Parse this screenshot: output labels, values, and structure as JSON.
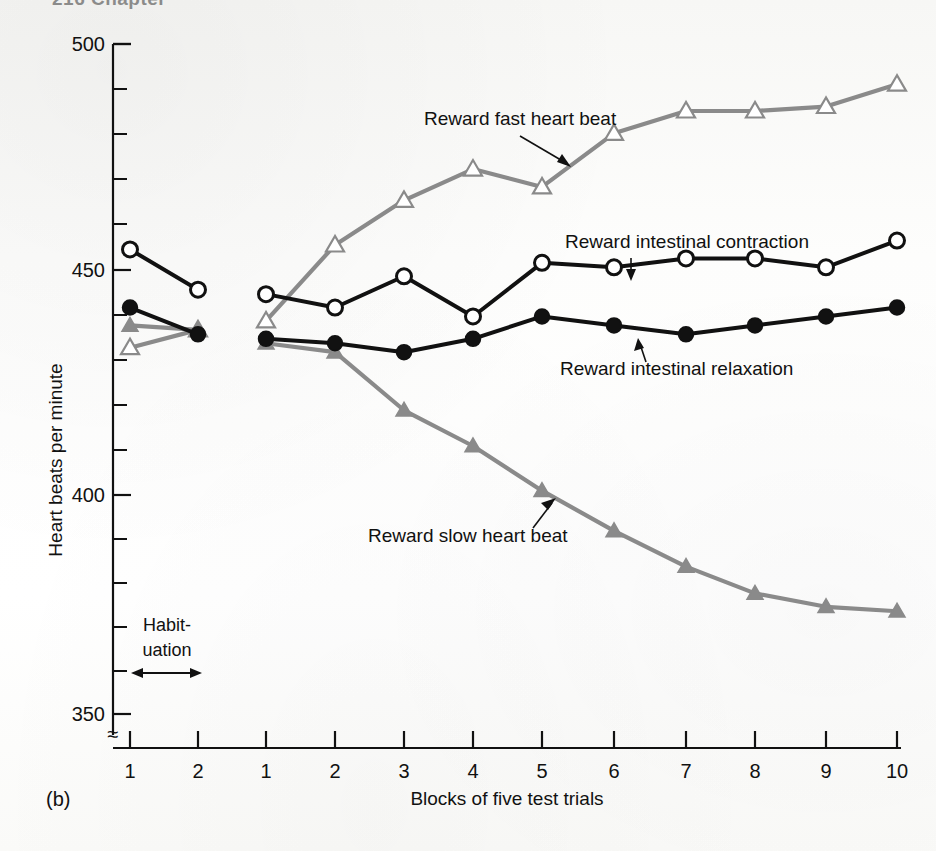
{
  "page": {
    "running_head": "216  Chapter",
    "panel_label": "(b)"
  },
  "annotations": {
    "habituation_line1": "Habit-",
    "habituation_line2": "uation"
  },
  "chart_data": {
    "type": "line",
    "title": "",
    "xlabel": "Blocks of five test trials",
    "ylabel": "Heart beats per minute",
    "ylim": [
      350,
      500
    ],
    "y_major_ticks": [
      350,
      400,
      450,
      500
    ],
    "y_major_tick_labels": [
      "350",
      "400",
      "450",
      "500"
    ],
    "y_minor_tick_step": 10,
    "grid": false,
    "axis_break": "≈",
    "x_habituation_ticks": [
      "1",
      "2"
    ],
    "x_test_ticks": [
      "1",
      "2",
      "3",
      "4",
      "5",
      "6",
      "7",
      "8",
      "9",
      "10"
    ],
    "legend_position": "inline-annotations",
    "series": [
      {
        "name": "Reward fast heart beat",
        "color": "#8a8a8a",
        "marker": "open-triangle",
        "habituation": [
          432,
          436
        ],
        "values": [
          438,
          455,
          465,
          472,
          468,
          480,
          485,
          485,
          486,
          491
        ]
      },
      {
        "name": "Reward slow heart beat",
        "color": "#8a8a8a",
        "marker": "filled-triangle",
        "habituation": [
          437,
          436
        ],
        "values": [
          433,
          431,
          418,
          410,
          400,
          391,
          383,
          377,
          374,
          373
        ]
      },
      {
        "name": "Reward intestinal contraction",
        "color": "#111111",
        "marker": "open-circle",
        "habituation": [
          454,
          445
        ],
        "values": [
          444,
          441,
          448,
          439,
          451,
          450,
          452,
          452,
          450,
          456
        ]
      },
      {
        "name": "Reward intestinal relaxation",
        "color": "#111111",
        "marker": "filled-circle",
        "habituation": [
          441,
          435
        ],
        "values": [
          434,
          433,
          431,
          434,
          439,
          437,
          435,
          437,
          439,
          441
        ]
      }
    ]
  }
}
